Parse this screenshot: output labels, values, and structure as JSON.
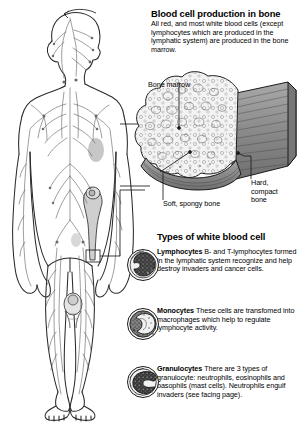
{
  "heading": {
    "title": "Blood cell production in bone",
    "intro": "All red, and most white blood cells (except lymphocytes which are produced in the lymphatic system) are produced in the bone marrow."
  },
  "bone_diagram": {
    "labels": {
      "marrow": "Bone marrow",
      "spongy": "Soft, spongy bone",
      "compact": "Hard, compact bone"
    },
    "colors": {
      "outline": "#1a1a1a",
      "compact_bone_fill": "#8e8e8e",
      "marrow_fill": "#f2f2f2",
      "spongy_fill": "#efefef"
    }
  },
  "body_figure": {
    "name": "lymphatic-system-body-outline",
    "colors": {
      "outline": "#2b2b2b",
      "vessels": "#5a5a5a",
      "organ_shade": "#b9b9b9",
      "bone_highlight": "#c9c9c9"
    }
  },
  "white_blood_cells": {
    "section_title": "Types of white blood cell",
    "items": [
      {
        "name": "Lymphocytes",
        "description": "B- and T-lymphocytes formed in the lymphatic system recognize and help destroy invaders and cancer cells.",
        "art": "lymphocyte-cell-illustration"
      },
      {
        "name": "Monocytes",
        "description": "These cells are transfomed into macrophages which help to regulate lymphocyte activity.",
        "art": "monocyte-cell-illustration"
      },
      {
        "name": "Granulocytes",
        "description": "There are 3 types of granulocyte: neutrophils, eosinophils and basophils (mast cells). Neutrophils engulf invaders (see facing page).",
        "art": "granulocyte-cell-illustration"
      }
    ]
  }
}
